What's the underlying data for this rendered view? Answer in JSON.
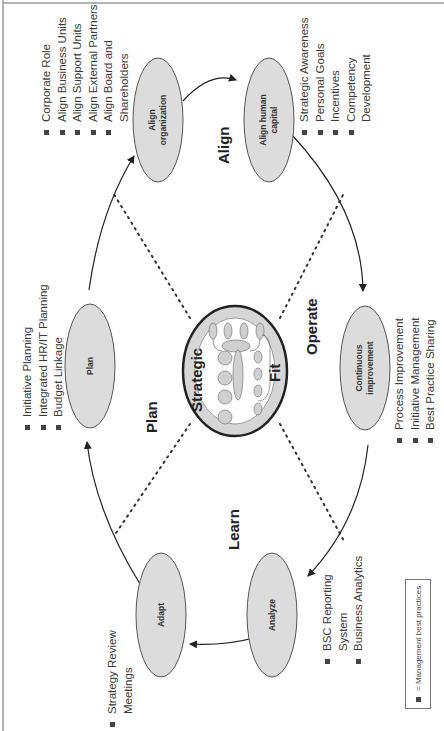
{
  "center": {
    "word_top": "Strategic",
    "word_bottom": "Fit"
  },
  "phases": {
    "plan": "Plan",
    "align": "Align",
    "operate": "Operate",
    "learn": "Learn"
  },
  "nodes": {
    "plan": [
      "Plan"
    ],
    "align_org": [
      "Align",
      "organization"
    ],
    "align_human": [
      "Align human",
      "capital"
    ],
    "continuous": [
      "Continuous",
      "improvement"
    ],
    "analyze": [
      "Analyze"
    ],
    "adapt": [
      "Adapt"
    ]
  },
  "bullets": {
    "plan": [
      "Initiative Planning",
      "Integrated HR/IT Planning",
      "Budget Linkage"
    ],
    "align_org": [
      "Corporate Role",
      "Align Business Units",
      "Align Support Units",
      "Align External Partners",
      "Align Board and",
      "Shareholders"
    ],
    "align_human": [
      "Strategic Awareness",
      "Personal Goals",
      "Incentives",
      "Competency",
      "Development"
    ],
    "continuous": [
      "Process Improvement",
      "Initiative Management",
      "Best Practice Sharing"
    ],
    "analyze": [
      "BSC Reporting",
      "System",
      "Business Analytics"
    ],
    "adapt": [
      "Strategy Review",
      "Meetings"
    ]
  },
  "legend": {
    "text": "= Management best practices"
  },
  "colors": {
    "node_fill": "#dcdcdc",
    "node_stroke": "#555555",
    "ring_fill": "#d6d6d6",
    "ring_stroke": "#222222"
  }
}
